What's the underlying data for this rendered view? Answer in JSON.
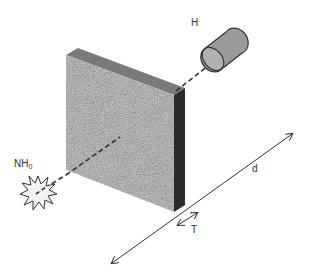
{
  "diagram": {
    "type": "radiation-shielding-geometry",
    "labels": {
      "source": "NH",
      "source_subscript": "0",
      "detector": "H",
      "distance": "d",
      "thickness": "T"
    },
    "elements": {
      "source": {
        "shape": "starburst",
        "description": "point source"
      },
      "shield": {
        "shape": "slab",
        "description": "shielding slab"
      },
      "detector": {
        "shape": "cylinder",
        "description": "detector"
      },
      "beam": {
        "style": "dashed",
        "description": "line of sight from source through shield to detector"
      },
      "distance_arrow": {
        "style": "double-headed"
      },
      "thickness_arrow": {
        "style": "double-headed"
      }
    },
    "colors": {
      "slab_front": "#b5b5b5",
      "slab_top": "#7a7a7a",
      "slab_side": "#2a2a2a",
      "cylinder_fill": "#9a9a9a",
      "cylinder_cap": "#b8b8b8",
      "starburst_fill": "#f2f2f2",
      "line": "#333333",
      "label": "#333333"
    }
  }
}
